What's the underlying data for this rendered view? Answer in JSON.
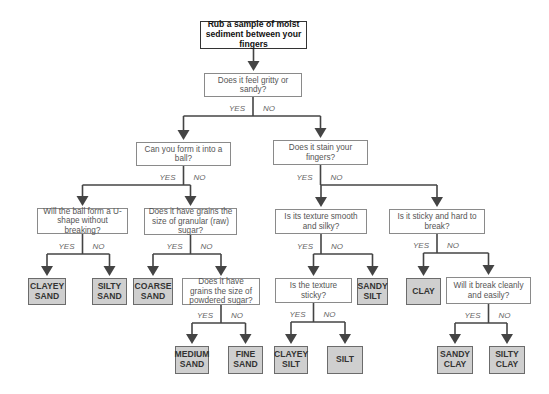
{
  "diagram": {
    "colors": {
      "leaf_fill": "#cfcfcf",
      "line": "#444444",
      "question_text": "#555555"
    },
    "branch_labels": {
      "yes": "YES",
      "no": "NO"
    },
    "root": {
      "text": "Rub a sample of moist sediment between your fingers"
    },
    "questions": {
      "q_gritty": "Does it feel gritty or sandy?",
      "q_ball": "Can you form it into a ball?",
      "q_stain": "Does it stain your fingers?",
      "q_ushape": "Will the ball form a U-shape without breaking?",
      "q_rawsugar": "Does it have grains the size of granular (raw) sugar?",
      "q_smooth": "Is its texture smooth and silky?",
      "q_sticky_hard": "Is it sticky and hard to break?",
      "q_powdered": "Does it have grains the size of powdered sugar?",
      "q_texture_sticky": "Is the texture sticky?",
      "q_break_clean": "Will it break cleanly and easily?"
    },
    "results": {
      "clayey_sand": "CLAYEY SAND",
      "silty_sand": "SILTY SAND",
      "coarse_sand": "COARSE SAND",
      "medium_sand": "MEDIUM SAND",
      "fine_sand": "FINE SAND",
      "clayey_silt": "CLAYEY SILT",
      "silt": "SILT",
      "sandy_silt": "SANDY SILT",
      "clay": "CLAY",
      "sandy_clay": "SANDY CLAY",
      "silty_clay": "SILTY CLAY"
    },
    "edges": [
      {
        "from": "root",
        "to": "q_gritty",
        "label": ""
      },
      {
        "from": "q_gritty",
        "to": "q_ball",
        "label": "YES"
      },
      {
        "from": "q_gritty",
        "to": "q_stain",
        "label": "NO"
      },
      {
        "from": "q_ball",
        "to": "q_ushape",
        "label": "YES"
      },
      {
        "from": "q_ball",
        "to": "q_rawsugar",
        "label": "NO"
      },
      {
        "from": "q_ushape",
        "to": "clayey_sand",
        "label": "YES"
      },
      {
        "from": "q_ushape",
        "to": "silty_sand",
        "label": "NO"
      },
      {
        "from": "q_rawsugar",
        "to": "coarse_sand",
        "label": "YES"
      },
      {
        "from": "q_rawsugar",
        "to": "q_powdered",
        "label": "NO"
      },
      {
        "from": "q_powdered",
        "to": "medium_sand",
        "label": "YES"
      },
      {
        "from": "q_powdered",
        "to": "fine_sand",
        "label": "NO"
      },
      {
        "from": "q_stain",
        "to": "q_smooth",
        "label": "YES"
      },
      {
        "from": "q_stain",
        "to": "q_sticky_hard",
        "label": "NO"
      },
      {
        "from": "q_smooth",
        "to": "q_texture_sticky",
        "label": "YES"
      },
      {
        "from": "q_smooth",
        "to": "sandy_silt",
        "label": "NO"
      },
      {
        "from": "q_texture_sticky",
        "to": "clayey_silt",
        "label": "YES"
      },
      {
        "from": "q_texture_sticky",
        "to": "silt",
        "label": "NO"
      },
      {
        "from": "q_sticky_hard",
        "to": "clay",
        "label": "YES"
      },
      {
        "from": "q_sticky_hard",
        "to": "q_break_clean",
        "label": "NO"
      },
      {
        "from": "q_break_clean",
        "to": "sandy_clay",
        "label": "YES"
      },
      {
        "from": "q_break_clean",
        "to": "silty_clay",
        "label": "NO"
      }
    ]
  }
}
